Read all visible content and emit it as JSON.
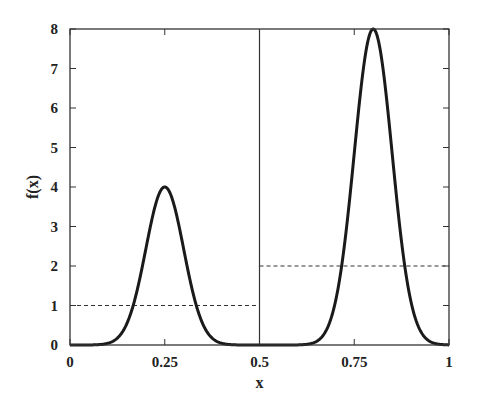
{
  "chart_data": {
    "type": "line",
    "title": "",
    "xlabel": "x",
    "ylabel": "f(x)",
    "xlim": [
      0,
      1
    ],
    "ylim": [
      0,
      8
    ],
    "grid": false,
    "legend": null,
    "x_ticks": [
      "0",
      "0.25",
      "0.5",
      "0.75",
      "1"
    ],
    "y_ticks": [
      "0",
      "1",
      "2",
      "3",
      "4",
      "5",
      "6",
      "7",
      "8"
    ],
    "series": [
      {
        "name": "f(x)",
        "style": "solid-thick",
        "color": "#1a1a1a",
        "description": "Two Gaussian bumps: peak 4 at x=0.25 and peak 8 at x=0.8 (sigma≈0.05)",
        "components": [
          {
            "amplitude": 4,
            "center": 0.25,
            "sigma": 0.05
          },
          {
            "amplitude": 8,
            "center": 0.8,
            "sigma": 0.05
          }
        ]
      },
      {
        "name": "average-left",
        "style": "dashed",
        "color": "#333333",
        "x": [
          0,
          0.5
        ],
        "values": [
          1,
          1
        ]
      },
      {
        "name": "average-right",
        "style": "dashed",
        "color": "#333333",
        "x": [
          0.5,
          1
        ],
        "values": [
          2,
          2
        ]
      }
    ],
    "annotations": [
      {
        "type": "vertical-line",
        "x": 0.5,
        "style": "solid-thin"
      }
    ]
  }
}
